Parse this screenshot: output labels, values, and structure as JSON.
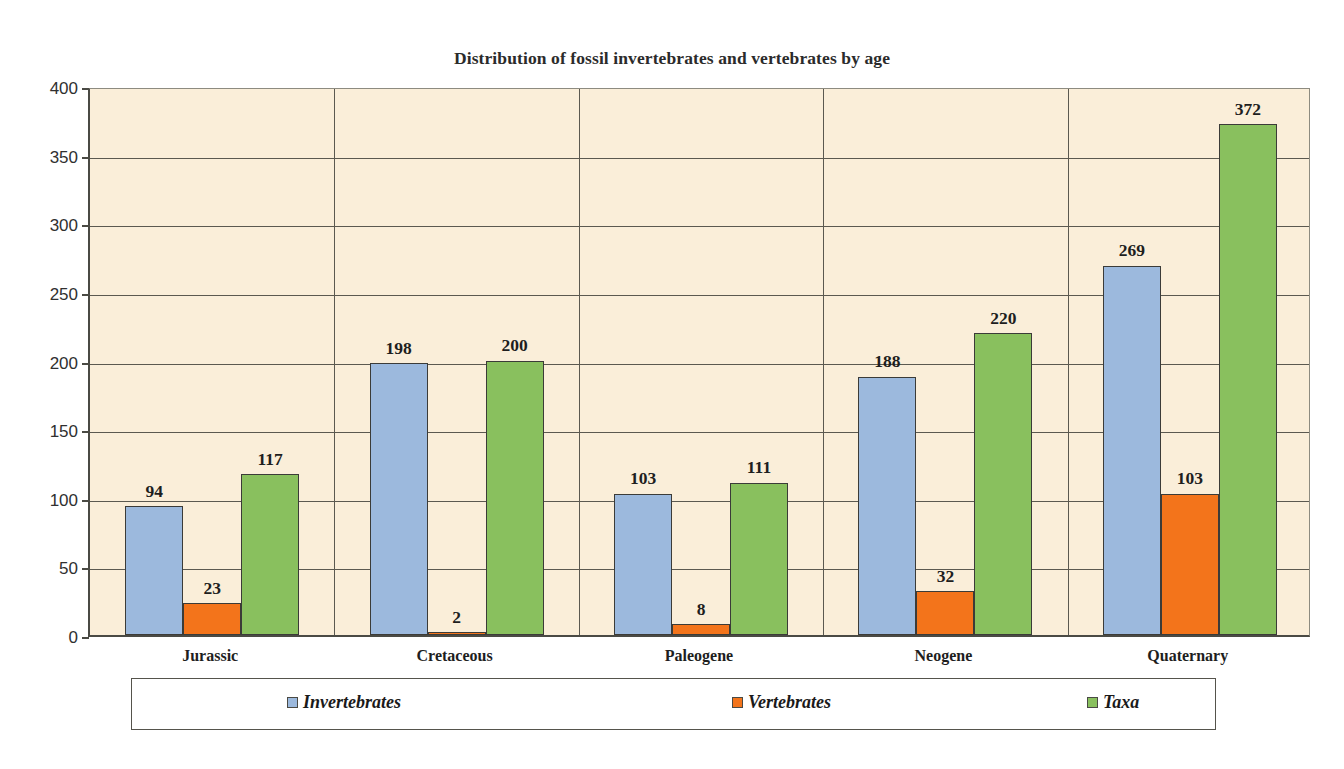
{
  "chart_data": {
    "type": "bar",
    "title": "Distribution of fossil invertebrates and vertebrates by age",
    "xlabel": "",
    "ylabel": "",
    "ylim": [
      0,
      400
    ],
    "ytick_step": 50,
    "yticks": [
      "0",
      "50",
      "100",
      "150",
      "200",
      "250",
      "300",
      "350",
      "400"
    ],
    "grid": "horizontal-and-category-separators",
    "legend_position": "bottom",
    "categories": [
      "Jurassic",
      "Cretaceous",
      "Paleogene",
      "Neogene",
      "Quaternary"
    ],
    "series": [
      {
        "name": "Invertebrates",
        "color": "#9cb9dd",
        "values": [
          94,
          198,
          103,
          188,
          269
        ]
      },
      {
        "name": "Vertebrates",
        "color": "#f3741b",
        "values": [
          23,
          2,
          8,
          32,
          103
        ]
      },
      {
        "name": "Taxa",
        "color": "#89c05e",
        "values": [
          117,
          200,
          111,
          220,
          372
        ]
      }
    ],
    "data_labels": [
      [
        "94",
        "23",
        "117"
      ],
      [
        "198",
        "2",
        "200"
      ],
      [
        "103",
        "8",
        "111"
      ],
      [
        "188",
        "32",
        "220"
      ],
      [
        "269",
        "103",
        "372"
      ]
    ],
    "plot_background_color": "#faeed9",
    "legend_background_color": "#ffffff",
    "axis_color": "#4a4a44",
    "gridline_color": "#5b5950",
    "page_background_color": "#ffffff"
  }
}
